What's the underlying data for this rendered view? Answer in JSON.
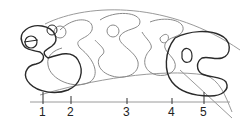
{
  "diagram": {
    "type": "overlaid-morphology-stages",
    "axis": {
      "ticks": [
        {
          "label": "1",
          "x": 43
        },
        {
          "label": "2",
          "x": 71
        },
        {
          "label": "3",
          "x": 127
        },
        {
          "label": "4",
          "x": 172
        },
        {
          "label": "5",
          "x": 204
        }
      ]
    },
    "colors": {
      "dark_stroke": "#2a2a2a",
      "light_stroke": "#8a8a8a",
      "axis": "#9a9a9a",
      "background": "#ffffff"
    }
  }
}
